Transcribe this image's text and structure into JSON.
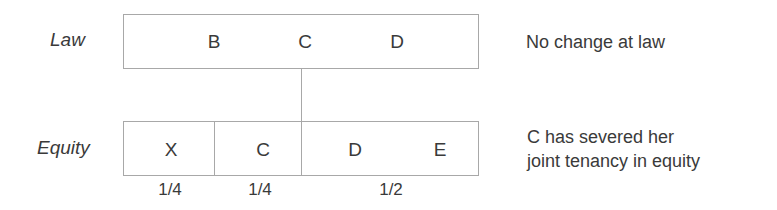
{
  "law": {
    "label": "Law",
    "holders": [
      "B",
      "C",
      "D"
    ],
    "note": "No change at law"
  },
  "equity": {
    "label": "Equity",
    "holders": [
      "X",
      "C",
      "D",
      "E"
    ],
    "shares": [
      "1/4",
      "1/4",
      "1/2"
    ],
    "note_line1": "C has severed her",
    "note_line2": "joint tenancy in equity"
  }
}
